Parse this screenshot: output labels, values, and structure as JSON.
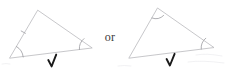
{
  "figure": {
    "caption_between": "or",
    "background_color": "#ffffff",
    "stroke_color": "#b9b9bd",
    "arc_color": "#9a9aa0",
    "check_color": "#1a1a1a",
    "items": [
      {
        "id": "left-figure",
        "shape_label": "triangle",
        "marked_angles": [
          "bottom-left-vertex",
          "bottom-right-vertex"
        ],
        "side_tick_marks": 1,
        "verdict_mark": "check",
        "vertices": {
          "apex": [
            37,
            10
          ],
          "bottom_left": [
            9,
            58
          ],
          "bottom_right": [
            92,
            48
          ]
        }
      },
      {
        "id": "right-figure",
        "shape_label": "triangle",
        "marked_angles": [
          "apex-vertex",
          "bottom-right-vertex"
        ],
        "side_tick_marks": 0,
        "verdict_mark": "check",
        "vertices": {
          "apex": [
            157,
            8
          ],
          "bottom_left": [
            129,
            58
          ],
          "bottom_right": [
            214,
            48
          ]
        }
      }
    ]
  }
}
